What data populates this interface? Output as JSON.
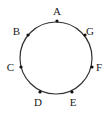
{
  "diagram": {
    "type": "circle-with-points",
    "circle": {
      "cx": 56,
      "cy": 58,
      "r": 36,
      "stroke": "#333333"
    },
    "points": [
      {
        "label": "A",
        "x": 57,
        "y": 21,
        "lx": 57,
        "ly": 15,
        "anchor": "middle"
      },
      {
        "label": "B",
        "x": 28,
        "y": 35,
        "lx": 20,
        "ly": 35,
        "anchor": "end"
      },
      {
        "label": "C",
        "x": 21,
        "y": 67,
        "lx": 14,
        "ly": 71,
        "anchor": "end"
      },
      {
        "label": "D",
        "x": 40,
        "y": 92,
        "lx": 38,
        "ly": 106,
        "anchor": "middle"
      },
      {
        "label": "E",
        "x": 72,
        "y": 92,
        "lx": 73,
        "ly": 106,
        "anchor": "middle"
      },
      {
        "label": "F",
        "x": 92,
        "y": 67,
        "lx": 96,
        "ly": 71,
        "anchor": "start"
      },
      {
        "label": "G",
        "x": 85,
        "y": 35,
        "lx": 86,
        "ly": 35,
        "anchor": "start"
      }
    ]
  }
}
